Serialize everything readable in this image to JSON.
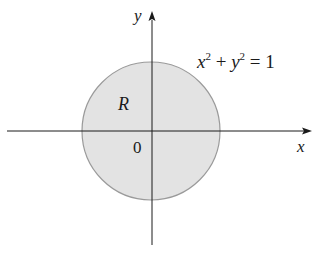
{
  "diagram": {
    "axes": {
      "x_label": "x",
      "y_label": "y",
      "origin_label": "0"
    },
    "region": {
      "label": "R",
      "fill_color": "#e3e3e3",
      "stroke_color": "#9a9a9a"
    },
    "equation": {
      "x": "x",
      "x_exp": "2",
      "plus": " + ",
      "y": "y",
      "y_exp": "2",
      "rhs": " = 1"
    },
    "colors": {
      "axis": "#1a1a1a",
      "background": "#ffffff"
    }
  }
}
